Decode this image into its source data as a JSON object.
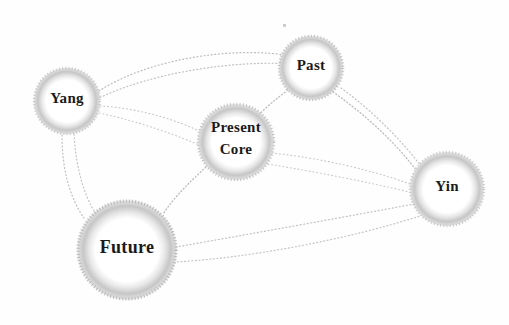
{
  "diagram": {
    "style": "dotted scanned network graph",
    "background_color": "#fefefe",
    "node_fill_color": "#ffffff",
    "node_halo_color": "#b9b9b9",
    "edge_color": "#b0b0b0",
    "label_color": "#1a1a1a",
    "nodes": [
      {
        "id": "yang",
        "label": "Yang",
        "cx": 67,
        "cy": 101,
        "r": 34,
        "font_size": 15
      },
      {
        "id": "past",
        "label": "Past",
        "cx": 311,
        "cy": 68,
        "r": 33,
        "font_size": 15
      },
      {
        "id": "present",
        "label": "Present",
        "label2": "Core",
        "cx": 236,
        "cy": 142,
        "r": 39,
        "font_size": 15
      },
      {
        "id": "yin",
        "label": "Yin",
        "cx": 447,
        "cy": 189,
        "r": 38,
        "font_size": 15
      },
      {
        "id": "future",
        "label": "Future",
        "cx": 127,
        "cy": 250,
        "r": 51,
        "font_size": 18
      }
    ],
    "edges": [
      {
        "from": "yang",
        "to": "past",
        "kind": "arc-up"
      },
      {
        "from": "yang",
        "to": "past",
        "kind": "arc-up2"
      },
      {
        "from": "yang",
        "to": "present",
        "kind": "arc-low"
      },
      {
        "from": "yang",
        "to": "present",
        "kind": "arc-low2"
      },
      {
        "from": "yang",
        "to": "future",
        "kind": "line"
      },
      {
        "from": "yang",
        "to": "future",
        "kind": "line2"
      },
      {
        "from": "past",
        "to": "present",
        "kind": "line"
      },
      {
        "from": "past",
        "to": "yin",
        "kind": "arc"
      },
      {
        "from": "past",
        "to": "yin",
        "kind": "arc2"
      },
      {
        "from": "present",
        "to": "yin",
        "kind": "arc"
      },
      {
        "from": "present",
        "to": "yin",
        "kind": "arc2"
      },
      {
        "from": "present",
        "to": "future",
        "kind": "line"
      },
      {
        "from": "future",
        "to": "yin",
        "kind": "arc-down"
      },
      {
        "from": "future",
        "to": "yin",
        "kind": "arc-down2"
      }
    ],
    "artifacts": [
      {
        "name": "scan-speck",
        "x": 283,
        "y": 24
      }
    ]
  }
}
